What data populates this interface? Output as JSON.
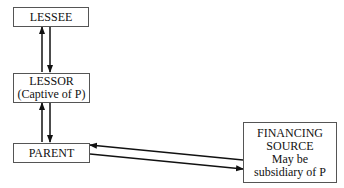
{
  "nodes": {
    "lessee": {
      "label": "LESSEE"
    },
    "lessor": {
      "line1": "LESSOR",
      "line2": "(Captive of P)"
    },
    "parent": {
      "label": "PARENT"
    },
    "financing": {
      "line1": "FINANCING",
      "line2": "SOURCE",
      "line3": "May be",
      "line4": "subsidiary of P"
    }
  },
  "edges": [
    {
      "from": "lessor",
      "to": "lessee"
    },
    {
      "from": "lessee",
      "to": "lessor"
    },
    {
      "from": "parent",
      "to": "lessor"
    },
    {
      "from": "lessor",
      "to": "parent"
    },
    {
      "from": "financing",
      "to": "parent"
    },
    {
      "from": "parent",
      "to": "financing"
    }
  ]
}
